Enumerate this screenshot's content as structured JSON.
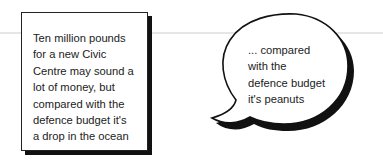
{
  "diagram": {
    "box_note": {
      "lines": [
        "Ten million pounds",
        "for a new Civic",
        "Centre may sound a",
        "lot of money, but",
        "compared with the",
        "defence budget it's",
        "a drop in the ocean"
      ]
    },
    "speech_bubble": {
      "lines": [
        "... compared",
        "with the",
        "defence budget",
        "it's peanuts"
      ]
    },
    "colors": {
      "background": "#ffffff",
      "stroke": "#111111",
      "text": "#222222",
      "rule": "#e6e6e6"
    }
  }
}
